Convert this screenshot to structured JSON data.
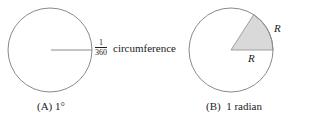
{
  "figure": {
    "panel_a": {
      "caption": "(A) 1°",
      "fraction_numerator": "1",
      "fraction_denominator": "360",
      "label": "circumference"
    },
    "panel_b": {
      "caption": "(B)  1 radian",
      "radius_label_bottom": "R",
      "radius_label_arc": "R",
      "sector_fill": "#d9d9d9"
    },
    "colors": {
      "stroke": "#8a8a8a",
      "text": "#222222"
    }
  }
}
